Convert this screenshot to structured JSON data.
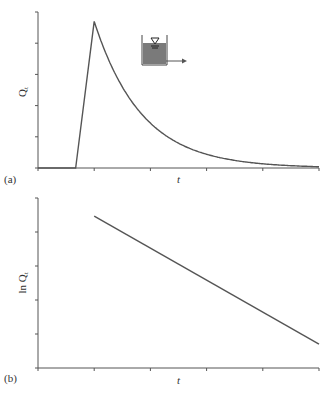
{
  "chart_data": [
    {
      "id": "a",
      "type": "line",
      "panel_label": "(a)",
      "title": "",
      "xlabel": "t",
      "ylabel": "Q_t",
      "ylabel_display": "Q",
      "ylabel_sub": "t",
      "x_ticks": 6,
      "y_ticks": 6,
      "tick_labels_shown": false,
      "grid": false,
      "description": "Outflow from linear reservoir: zero, linear rise to peak, then exponential recession",
      "x": [
        0,
        0.67,
        1.0,
        1.5,
        2.0,
        2.5,
        3.0,
        3.5,
        4.0,
        4.5,
        5.0
      ],
      "values": [
        0,
        0,
        4.7,
        2.6,
        1.4,
        0.78,
        0.43,
        0.24,
        0.13,
        0.07,
        0.04
      ],
      "xlim": [
        0,
        5
      ],
      "ylim": [
        0,
        5
      ],
      "inset": "reservoir-tank-icon"
    },
    {
      "id": "b",
      "type": "line",
      "panel_label": "(b)",
      "title": "",
      "xlabel": "t",
      "ylabel": "ln Q_t",
      "ylabel_display": "ln Q",
      "ylabel_sub": "t",
      "x_ticks": 6,
      "y_ticks": 6,
      "tick_labels_shown": false,
      "grid": false,
      "description": "Log of recession flow decreases linearly with time",
      "x": [
        1.0,
        5.0
      ],
      "values": [
        4.47,
        0.7
      ],
      "xlim": [
        0,
        5
      ],
      "ylim": [
        0,
        5
      ]
    }
  ],
  "colors": {
    "line": "#555555",
    "axis": "#555555",
    "tank_fill": "#7a7a7a",
    "text": "#333333"
  }
}
